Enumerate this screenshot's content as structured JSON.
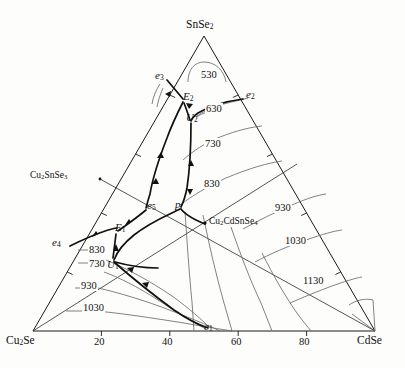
{
  "figure": {
    "type": "ternary-liquidus-projection",
    "system": "Cu2Se - SnSe2 - CdSe"
  },
  "corners": {
    "top": {
      "label_html": "SnSe<sub>2</sub>",
      "name": "SnSe2",
      "x": 204,
      "y": 36
    },
    "bottom_left": {
      "label_html": "Cu<sub>2</sub>Se",
      "name": "Cu2Se",
      "x": 33,
      "y": 331
    },
    "bottom_right": {
      "label_html": "CdSe",
      "name": "CdSe",
      "x": 375,
      "y": 331
    }
  },
  "axis": {
    "bottom_ticks": [
      {
        "value": "20",
        "frac": 0.2
      },
      {
        "value": "40",
        "frac": 0.4
      },
      {
        "value": "60",
        "frac": 0.6
      },
      {
        "value": "80",
        "frac": 0.8
      }
    ],
    "edge_tick_fracs": [
      0.2,
      0.4,
      0.6,
      0.8
    ]
  },
  "compounds": [
    {
      "id": "cu2snse3",
      "label_html": "Cu<sub>2</sub>SnSe<sub>3</sub>",
      "x": 78,
      "y": 175
    },
    {
      "id": "cu2cdsnse4",
      "label_html": "Cu<sub>2</sub>CdSnSe<sub>4</sub>",
      "x": 196,
      "y": 221
    }
  ],
  "invariant_points": [
    {
      "id": "e1",
      "label_html": "e<sub>1</sub>",
      "x": 209,
      "y": 327
    },
    {
      "id": "e2",
      "label_html": "e<sub>2</sub>",
      "x": 245,
      "y": 95
    },
    {
      "id": "e3",
      "label_html": "e<sub>3</sub>",
      "x": 164,
      "y": 76
    },
    {
      "id": "e4",
      "label_html": "e<sub>4</sub>",
      "x": 65,
      "y": 243
    },
    {
      "id": "e5",
      "label_html": "e<sub>5</sub>",
      "x": 153,
      "y": 206
    },
    {
      "id": "E1",
      "label_html": "E<sub>1</sub>",
      "x": 117,
      "y": 230
    },
    {
      "id": "E2",
      "label_html": "E<sub>2</sub>",
      "x": 185,
      "y": 99
    },
    {
      "id": "U1",
      "label_html": "U<sub>1</sub>",
      "x": 112,
      "y": 263
    },
    {
      "id": "U2",
      "label_html": "U<sub>2</sub>",
      "x": 189,
      "y": 119
    },
    {
      "id": "p",
      "label_html": "p",
      "x": 179,
      "y": 207
    }
  ],
  "isotherms": [
    {
      "value": "530",
      "x": 210,
      "y": 78
    },
    {
      "value": "630",
      "x": 213,
      "y": 111
    },
    {
      "value": "730",
      "x": 212,
      "y": 146
    },
    {
      "value": "830",
      "x": 210,
      "y": 186
    },
    {
      "value": "930",
      "x": 284,
      "y": 210
    },
    {
      "value": "1030",
      "x": 297,
      "y": 243
    },
    {
      "value": "1130",
      "x": 315,
      "y": 283
    },
    {
      "value": "830",
      "x": 96,
      "y": 255
    },
    {
      "value": "730",
      "x": 96,
      "y": 268
    },
    {
      "value": "930",
      "x": 89,
      "y": 287
    },
    {
      "value": "1030",
      "x": 92,
      "y": 310
    }
  ],
  "colors": {
    "ink": "#1a1a1a",
    "curve": "#4a4a4a",
    "background": "#fdfdfb"
  }
}
